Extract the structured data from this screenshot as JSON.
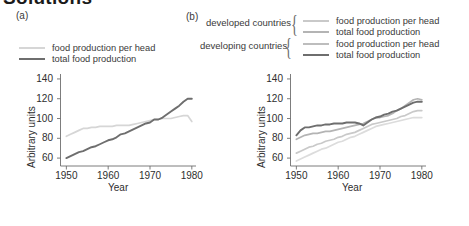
{
  "heading_cut": "Solutions",
  "panels": {
    "a": {
      "label": "(a)",
      "legend": [
        {
          "name": "food production per head",
          "color": "#d6d6d6"
        },
        {
          "name": "total food production",
          "color": "#6e6e6e"
        }
      ]
    },
    "b": {
      "label": "(b)",
      "groups": [
        {
          "title": "developed countries"
        },
        {
          "title": "developing countries"
        }
      ],
      "legend": [
        {
          "name": "food production per head",
          "color": "#c9c9c9"
        },
        {
          "name": "total food production",
          "color": "#b4b4b4"
        },
        {
          "name": "food production per head",
          "color": "#bdbdbd"
        },
        {
          "name": "total food production",
          "color": "#6e6e6e"
        }
      ]
    }
  },
  "axes": {
    "ylabel": "Arbitrary units",
    "xlabel": "Year",
    "yticks": [
      "140",
      "120",
      "100",
      "80",
      "60"
    ],
    "xticks": [
      "1950",
      "1960",
      "1970",
      "1980"
    ]
  },
  "chart_data": [
    {
      "type": "line",
      "title": "(a)",
      "xlabel": "Year",
      "ylabel": "Arbitrary units",
      "xlim": [
        1948,
        1981
      ],
      "ylim": [
        52,
        145
      ],
      "xticks": [
        1950,
        1960,
        1970,
        1980
      ],
      "yticks": [
        60,
        80,
        100,
        120,
        140
      ],
      "grid": false,
      "legend_position": "above-plot",
      "series": [
        {
          "name": "food production per head",
          "color": "#d6d6d6",
          "x": [
            1950,
            1951,
            1952,
            1953,
            1954,
            1955,
            1956,
            1957,
            1958,
            1959,
            1960,
            1961,
            1962,
            1963,
            1964,
            1965,
            1966,
            1967,
            1968,
            1969,
            1970,
            1971,
            1972,
            1973,
            1974,
            1975,
            1976,
            1977,
            1978,
            1979,
            1980
          ],
          "values": [
            82,
            84,
            86,
            88,
            90,
            90,
            91,
            91,
            92,
            92,
            92,
            92,
            93,
            93,
            93,
            93,
            94,
            95,
            96,
            97,
            98,
            99,
            99,
            100,
            100,
            100,
            101,
            102,
            103,
            103,
            97
          ]
        },
        {
          "name": "total food production",
          "color": "#6e6e6e",
          "x": [
            1950,
            1951,
            1952,
            1953,
            1954,
            1955,
            1956,
            1957,
            1958,
            1959,
            1960,
            1961,
            1962,
            1963,
            1964,
            1965,
            1966,
            1967,
            1968,
            1969,
            1970,
            1971,
            1972,
            1973,
            1974,
            1975,
            1976,
            1977,
            1978,
            1979,
            1980
          ],
          "values": [
            60,
            62,
            64,
            66,
            67,
            69,
            71,
            72,
            74,
            76,
            78,
            79,
            81,
            84,
            85,
            87,
            89,
            91,
            93,
            95,
            96,
            99,
            99,
            101,
            104,
            107,
            110,
            113,
            117,
            120,
            120
          ]
        }
      ]
    },
    {
      "type": "line",
      "title": "(b)",
      "xlabel": "Year",
      "ylabel": "Arbitrary units",
      "xlim": [
        1948,
        1981
      ],
      "ylim": [
        52,
        145
      ],
      "xticks": [
        1950,
        1960,
        1970,
        1980
      ],
      "yticks": [
        60,
        80,
        100,
        120,
        140
      ],
      "grid": false,
      "legend_position": "above-plot",
      "series": [
        {
          "name": "developed countries - total food production",
          "color": "#6e6e6e",
          "x": [
            1950,
            1951,
            1952,
            1953,
            1954,
            1955,
            1956,
            1957,
            1958,
            1959,
            1960,
            1961,
            1962,
            1963,
            1964,
            1965,
            1966,
            1967,
            1968,
            1969,
            1970,
            1971,
            1972,
            1973,
            1974,
            1975,
            1976,
            1977,
            1978,
            1979,
            1980
          ],
          "values": [
            83,
            88,
            91,
            91,
            92,
            93,
            93,
            94,
            94,
            95,
            95,
            95,
            96,
            96,
            96,
            95,
            93,
            96,
            99,
            101,
            102,
            104,
            105,
            107,
            108,
            110,
            112,
            114,
            116,
            117,
            117
          ]
        },
        {
          "name": "developed countries - food production per head",
          "color": "#b4b4b4",
          "x": [
            1950,
            1951,
            1952,
            1953,
            1954,
            1955,
            1956,
            1957,
            1958,
            1959,
            1960,
            1961,
            1962,
            1963,
            1964,
            1965,
            1966,
            1967,
            1968,
            1969,
            1970,
            1971,
            1972,
            1973,
            1974,
            1975,
            1976,
            1977,
            1978,
            1979,
            1980
          ],
          "values": [
            79,
            81,
            83,
            84,
            85,
            85,
            86,
            87,
            87,
            88,
            89,
            90,
            91,
            92,
            93,
            94,
            95,
            97,
            99,
            101,
            101,
            102,
            103,
            105,
            108,
            110,
            113,
            116,
            119,
            120,
            119
          ]
        },
        {
          "name": "developing countries - total food production",
          "color": "#c9c9c9",
          "x": [
            1950,
            1951,
            1952,
            1953,
            1954,
            1955,
            1956,
            1957,
            1958,
            1959,
            1960,
            1961,
            1962,
            1963,
            1964,
            1965,
            1966,
            1967,
            1968,
            1969,
            1970,
            1971,
            1972,
            1973,
            1974,
            1975,
            1976,
            1977,
            1978,
            1979,
            1980
          ],
          "values": [
            65,
            67,
            69,
            71,
            72,
            74,
            75,
            77,
            78,
            79,
            81,
            82,
            84,
            85,
            86,
            88,
            90,
            92,
            94,
            95,
            96,
            97,
            98,
            99,
            100,
            102,
            103,
            105,
            107,
            108,
            108
          ]
        },
        {
          "name": "developing countries - food production per head",
          "color": "#dcdcdc",
          "x": [
            1950,
            1951,
            1952,
            1953,
            1954,
            1955,
            1956,
            1957,
            1958,
            1959,
            1960,
            1961,
            1962,
            1963,
            1964,
            1965,
            1966,
            1967,
            1968,
            1969,
            1970,
            1971,
            1972,
            1973,
            1974,
            1975,
            1976,
            1977,
            1978,
            1979,
            1980
          ],
          "values": [
            57,
            59,
            61,
            63,
            65,
            67,
            69,
            70,
            72,
            74,
            76,
            77,
            79,
            81,
            82,
            84,
            86,
            88,
            90,
            92,
            93,
            94,
            95,
            96,
            97,
            98,
            99,
            100,
            101,
            101,
            101
          ]
        }
      ]
    }
  ]
}
